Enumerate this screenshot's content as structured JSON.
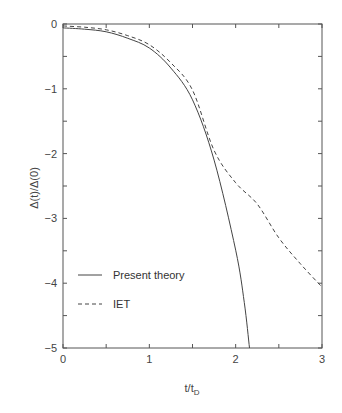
{
  "chart_data": {
    "type": "line",
    "title": "",
    "xlabel": "t/t_D",
    "xlabel_main": "t/t",
    "xlabel_sub": "D",
    "ylabel": "Δ(t)/Δ(0)",
    "xlim": [
      0,
      3
    ],
    "ylim": [
      -5,
      0
    ],
    "xticks": [
      0,
      1,
      2,
      3
    ],
    "yticks": [
      0,
      -1,
      -2,
      -3,
      -4,
      -5
    ],
    "xticks_minor": [
      0.5,
      1.5,
      2.5
    ],
    "yticks_minor": [
      -0.5,
      -1.5,
      -2.5,
      -3.5,
      -4.5
    ],
    "grid": false,
    "legend_position": "lower left",
    "series": [
      {
        "name": "Present theory",
        "style": "solid",
        "x": [
          0,
          0.25,
          0.5,
          0.75,
          1.0,
          1.25,
          1.5,
          1.75,
          2.0,
          2.1,
          2.16
        ],
        "y": [
          -0.06,
          -0.08,
          -0.12,
          -0.22,
          -0.37,
          -0.68,
          -1.17,
          -2.1,
          -3.49,
          -4.3,
          -5.0
        ]
      },
      {
        "name": "IET",
        "style": "dashed",
        "x": [
          0,
          0.25,
          0.5,
          0.75,
          1.0,
          1.25,
          1.5,
          1.75,
          2.0,
          2.25,
          2.5,
          2.75,
          3.0
        ],
        "y": [
          -0.03,
          -0.05,
          -0.09,
          -0.18,
          -0.32,
          -0.6,
          -1.02,
          -1.95,
          -2.45,
          -2.78,
          -3.3,
          -3.7,
          -4.06
        ]
      }
    ]
  },
  "legend": {
    "items": [
      {
        "label": "Present theory",
        "style": "solid"
      },
      {
        "label": "IET",
        "style": "dashed"
      }
    ]
  },
  "colors": {
    "axis": "#555555",
    "line": "#444444"
  }
}
